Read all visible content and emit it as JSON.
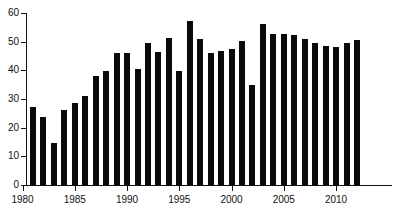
{
  "chart_data": {
    "type": "bar",
    "title": "",
    "subtitle": "",
    "xlabel": "",
    "ylabel": "",
    "xlim": [
      1980,
      2013
    ],
    "ylim": [
      0,
      60
    ],
    "grid": false,
    "legend": null,
    "bar_color": "#0a0a0a",
    "axis_color": "#111111",
    "background_color": "#ffffff",
    "ytick_labels": [
      "0",
      "10",
      "20",
      "30",
      "40",
      "50",
      "60"
    ],
    "ytick_values": [
      0,
      10,
      20,
      30,
      40,
      50,
      60
    ],
    "xtick_labels": [
      "1980",
      "1985",
      "1990",
      "1995",
      "2000",
      "2005",
      "2010"
    ],
    "xtick_values": [
      1980,
      1985,
      1990,
      1995,
      2000,
      2005,
      2010
    ],
    "categories": [
      "1981",
      "1982",
      "1983",
      "1984",
      "1985",
      "1986",
      "1987",
      "1988",
      "1989",
      "1990",
      "1991",
      "1992",
      "1993",
      "1994",
      "1995",
      "1996",
      "1997",
      "1998",
      "1999",
      "2000",
      "2001",
      "2002",
      "2003",
      "2004",
      "2005",
      "2006",
      "2007",
      "2008",
      "2009",
      "2010",
      "2011",
      "2012"
    ],
    "values": [
      27.2,
      23.8,
      14.5,
      26.0,
      28.6,
      31.2,
      38.1,
      39.6,
      46.2,
      46.2,
      40.3,
      49.4,
      46.5,
      51.3,
      39.6,
      57.3,
      50.8,
      46.0,
      46.6,
      47.6,
      50.1,
      34.8,
      56.0,
      52.7,
      52.8,
      52.4,
      50.9,
      49.5,
      48.4,
      48.3,
      49.4,
      50.7
    ]
  }
}
